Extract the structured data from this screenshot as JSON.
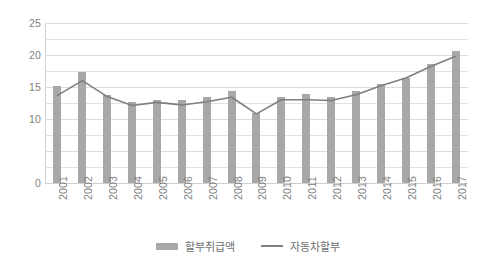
{
  "chart_data": {
    "type": "bar",
    "title": "",
    "subtitle": "",
    "xlabel": "",
    "ylabel": "",
    "ylim": [
      0,
      25
    ],
    "ytick_values": [
      0,
      10,
      15,
      20,
      25
    ],
    "ytick_labels": [
      "0",
      "10",
      "15",
      "20",
      "25"
    ],
    "gridline_step": 2.5,
    "grid": true,
    "legend_position": "bottom-center",
    "categories": [
      "2001",
      "2002",
      "2003",
      "2004",
      "2005",
      "2006",
      "2007",
      "2008",
      "2009",
      "2010",
      "2011",
      "2012",
      "2013",
      "2014",
      "2015",
      "2016",
      "2017"
    ],
    "series": [
      {
        "name": "할부취급액",
        "type": "bar",
        "color": "#a8a8a8",
        "values": [
          15.2,
          17.4,
          13.8,
          12.7,
          13.0,
          12.9,
          13.5,
          14.3,
          11.0,
          13.5,
          13.9,
          13.5,
          14.4,
          15.4,
          16.4,
          18.6,
          20.6
        ]
      },
      {
        "name": "자동차할부",
        "type": "line",
        "color": "#7f7f7f",
        "values": [
          13.7,
          16.0,
          13.5,
          12.1,
          12.6,
          12.2,
          12.7,
          13.4,
          10.8,
          13.0,
          13.0,
          12.9,
          13.8,
          15.2,
          16.4,
          18.2,
          19.8
        ]
      }
    ]
  },
  "legend": {
    "items": [
      {
        "label": "할부취급액",
        "marker": "bar-swatch",
        "color": "#a8a8a8"
      },
      {
        "label": "자동차할부",
        "marker": "line-swatch",
        "color": "#7f7f7f"
      }
    ]
  },
  "colors": {
    "bar": "#a8a8a8",
    "line": "#7f7f7f",
    "gridline": "#e2e2e2",
    "axis_text": "#808080",
    "background": "#ffffff"
  }
}
